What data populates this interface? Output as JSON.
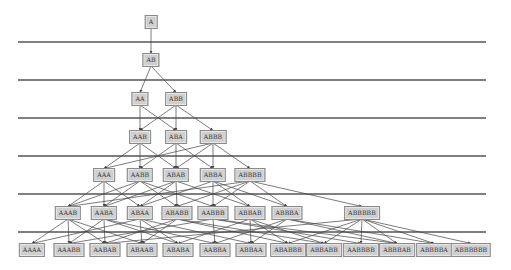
{
  "diagram": {
    "type": "layered-dag",
    "colors": {
      "node_fill": "#cfcfcf",
      "node_border": "#8a8a8a",
      "edge": "#444444",
      "separator": "#555555"
    },
    "separators_y": [
      42,
      80,
      118,
      156,
      194,
      232
    ],
    "separator_x_range": [
      18,
      486
    ],
    "levels": [
      {
        "y": 22,
        "nodes": [
          {
            "id": "A",
            "label": "A",
            "x": 151
          }
        ]
      },
      {
        "y": 60,
        "nodes": [
          {
            "id": "AB",
            "label": "AB",
            "x": 151
          }
        ]
      },
      {
        "y": 99,
        "nodes": [
          {
            "id": "AA",
            "label": "AA",
            "x": 140
          },
          {
            "id": "ABB",
            "label": "ABB",
            "x": 176
          }
        ]
      },
      {
        "y": 137,
        "nodes": [
          {
            "id": "AAB",
            "label": "AAB",
            "x": 140
          },
          {
            "id": "ABA",
            "label": "ABA",
            "x": 176
          },
          {
            "id": "ABBB",
            "label": "ABBB",
            "x": 213
          }
        ]
      },
      {
        "y": 175,
        "nodes": [
          {
            "id": "AAA",
            "label": "AAA",
            "x": 104
          },
          {
            "id": "AABB",
            "label": "AABB",
            "x": 140
          },
          {
            "id": "ABAB",
            "label": "ABAB",
            "x": 176
          },
          {
            "id": "ABBA",
            "label": "ABBA",
            "x": 213
          },
          {
            "id": "ABBBB",
            "label": "ABBBB",
            "x": 250
          }
        ]
      },
      {
        "y": 213,
        "nodes": [
          {
            "id": "AAAB",
            "label": "AAAB",
            "x": 68
          },
          {
            "id": "AABA",
            "label": "AABA",
            "x": 104
          },
          {
            "id": "ABAA",
            "label": "ABAA",
            "x": 140
          },
          {
            "id": "ABABB",
            "label": "ABABB",
            "x": 177
          },
          {
            "id": "AABBB",
            "label": "AABBB",
            "x": 213
          },
          {
            "id": "ABBAB",
            "label": "ABBAB",
            "x": 250
          },
          {
            "id": "ABBBA",
            "label": "ABBBA",
            "x": 287
          },
          {
            "id": "ABBBBB",
            "label": "ABBBBB",
            "x": 362
          }
        ]
      },
      {
        "y": 250,
        "nodes": [
          {
            "id": "AAAA",
            "label": "AAAA",
            "x": 32
          },
          {
            "id": "AAABB",
            "label": "AAABB",
            "x": 69
          },
          {
            "id": "AABAB",
            "label": "AABAB",
            "x": 105
          },
          {
            "id": "ABAAB",
            "label": "ABAAB",
            "x": 142
          },
          {
            "id": "ABABA",
            "label": "ABABA",
            "x": 178
          },
          {
            "id": "AABBA",
            "label": "AABBA",
            "x": 215
          },
          {
            "id": "ABBAA",
            "label": "ABBAA",
            "x": 251
          },
          {
            "id": "ABABBB",
            "label": "ABABBB",
            "x": 288
          },
          {
            "id": "ABBABB",
            "label": "ABBABB",
            "x": 324
          },
          {
            "id": "AABBBB",
            "label": "AABBBB",
            "x": 361
          },
          {
            "id": "ABBBAB",
            "label": "ABBBAB",
            "x": 397
          },
          {
            "id": "ABBBBA",
            "label": "ABBBBA",
            "x": 434
          },
          {
            "id": "ABBBBBB",
            "label": "ABBBBBB",
            "x": 471
          }
        ]
      }
    ],
    "edges": [
      [
        "A",
        "AB"
      ],
      [
        "AB",
        "AA"
      ],
      [
        "AB",
        "ABB"
      ],
      [
        "AA",
        "AAB"
      ],
      [
        "AA",
        "ABA"
      ],
      [
        "ABB",
        "AAB"
      ],
      [
        "ABB",
        "ABA"
      ],
      [
        "ABB",
        "ABBB"
      ],
      [
        "AAB",
        "AAA"
      ],
      [
        "AAB",
        "AABB"
      ],
      [
        "AAB",
        "ABAB"
      ],
      [
        "ABA",
        "AABB"
      ],
      [
        "ABA",
        "ABAB"
      ],
      [
        "ABA",
        "ABBA"
      ],
      [
        "ABBB",
        "AAA"
      ],
      [
        "ABBB",
        "ABAB"
      ],
      [
        "ABBB",
        "ABBA"
      ],
      [
        "ABBB",
        "ABBBB"
      ],
      [
        "AAA",
        "AAAB"
      ],
      [
        "AAA",
        "AABA"
      ],
      [
        "AAA",
        "ABAA"
      ],
      [
        "AABB",
        "AAAB"
      ],
      [
        "AABB",
        "AABA"
      ],
      [
        "AABB",
        "ABABB"
      ],
      [
        "AABB",
        "AABBB"
      ],
      [
        "ABAB",
        "AABA"
      ],
      [
        "ABAB",
        "ABAA"
      ],
      [
        "ABAB",
        "ABABB"
      ],
      [
        "ABAB",
        "ABBAB"
      ],
      [
        "ABBA",
        "ABAA"
      ],
      [
        "ABBA",
        "AABBB"
      ],
      [
        "ABBA",
        "ABBAB"
      ],
      [
        "ABBA",
        "ABBBA"
      ],
      [
        "ABBBB",
        "AAAB"
      ],
      [
        "ABBBB",
        "ABABB"
      ],
      [
        "ABBBB",
        "AABBB"
      ],
      [
        "ABBBB",
        "ABBBA"
      ],
      [
        "ABBBB",
        "ABBBBB"
      ],
      [
        "AAAB",
        "AAAA"
      ],
      [
        "AAAB",
        "AAABB"
      ],
      [
        "AAAB",
        "AABAB"
      ],
      [
        "AAAB",
        "ABAAB"
      ],
      [
        "AABA",
        "AAABB"
      ],
      [
        "AABA",
        "AABAB"
      ],
      [
        "AABA",
        "ABABA"
      ],
      [
        "AABA",
        "AABBA"
      ],
      [
        "ABAA",
        "AAAA"
      ],
      [
        "ABAA",
        "ABAAB"
      ],
      [
        "ABAA",
        "ABABA"
      ],
      [
        "ABAA",
        "ABBAA"
      ],
      [
        "ABABB",
        "AABAB"
      ],
      [
        "ABABB",
        "ABAAB"
      ],
      [
        "ABABB",
        "ABABBB"
      ],
      [
        "ABABB",
        "ABBABB"
      ],
      [
        "AABBB",
        "AAABB"
      ],
      [
        "AABBB",
        "AABBA"
      ],
      [
        "AABBB",
        "AABBBB"
      ],
      [
        "AABBB",
        "ABBBAB"
      ],
      [
        "ABBAB",
        "ABABA"
      ],
      [
        "ABBAB",
        "ABBAA"
      ],
      [
        "ABBAB",
        "ABABBB"
      ],
      [
        "ABBAB",
        "ABBABB"
      ],
      [
        "ABBBA",
        "AABBA"
      ],
      [
        "ABBBA",
        "ABBAA"
      ],
      [
        "ABBBA",
        "ABBBAB"
      ],
      [
        "ABBBA",
        "ABBBBA"
      ],
      [
        "ABBBBB",
        "AABAB"
      ],
      [
        "ABBBBB",
        "ABABBB"
      ],
      [
        "ABBBBB",
        "ABBABB"
      ],
      [
        "ABBBBB",
        "AABBBB"
      ],
      [
        "ABBBBB",
        "ABBBAB"
      ],
      [
        "ABBBBB",
        "ABBBBA"
      ],
      [
        "ABBBBB",
        "ABBBBBB"
      ]
    ]
  }
}
